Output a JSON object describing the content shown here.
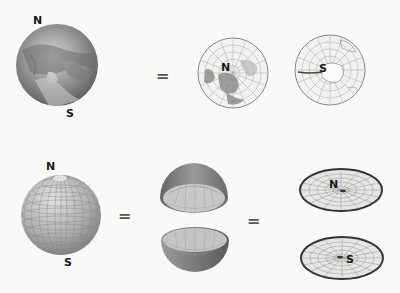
{
  "diagram": {
    "top_row": {
      "earth_globe": {
        "north_label": "N",
        "south_label": "S"
      },
      "equals_1": "=",
      "north_polar_map": {
        "label": "N"
      },
      "south_polar_map": {
        "label": "S"
      }
    },
    "bottom_row": {
      "grid_sphere": {
        "north_label": "N",
        "south_label": "S"
      },
      "equals_2": "=",
      "hemispheres": {
        "upper": "northern hemisphere dome",
        "lower": "southern hemisphere bowl"
      },
      "equals_3": "=",
      "flat_discs": {
        "north_label": "N",
        "south_label": "S"
      }
    }
  }
}
